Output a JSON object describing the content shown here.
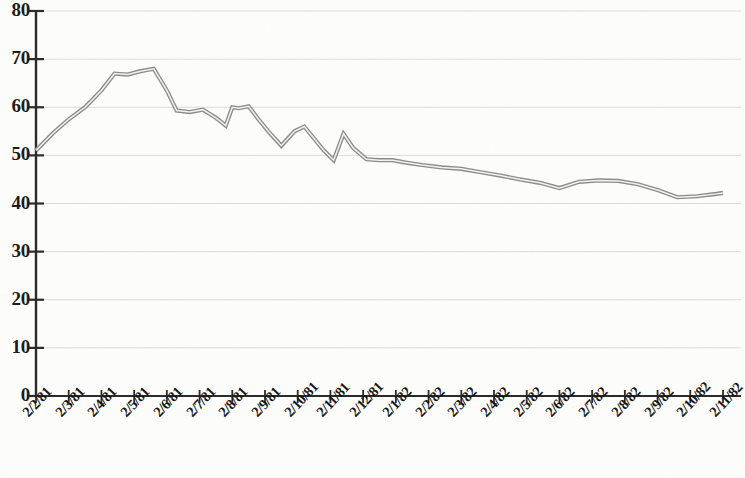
{
  "chart_data": {
    "type": "line",
    "title": "",
    "subtitle": "",
    "xlabel": "",
    "ylabel": "",
    "grid": true,
    "legend": "none",
    "ylim": [
      0,
      80
    ],
    "yticks": [
      0,
      10,
      20,
      30,
      40,
      50,
      60,
      70,
      80
    ],
    "ytick_labels": [
      "0",
      "10",
      "20",
      "30",
      "40",
      "50",
      "60",
      "70",
      "80"
    ],
    "categories": [
      "2/2/81",
      "2/3/81",
      "2/4/81",
      "2/5/81",
      "2/6/81",
      "2/7/81",
      "2/8/81",
      "2/9/81",
      "2/10/81",
      "2/11/81",
      "2/12/81",
      "2/1/82",
      "2/2/82",
      "2/3/82",
      "2/4/82",
      "2/5/82",
      "2/6/82",
      "2/7/82",
      "2/8/82",
      "2/9/82",
      "2/10/82",
      "2/11/82"
    ],
    "series": [
      {
        "name": "value",
        "color": "#8c8c8c",
        "x": [
          0,
          0.5,
          1,
          1.5,
          2,
          2.4,
          2.8,
          3.2,
          3.6,
          4,
          4.3,
          4.7,
          5.1,
          5.5,
          5.8,
          6.0,
          6.2,
          6.5,
          6.8,
          7.1,
          7.5,
          7.9,
          8.2,
          8.5,
          8.8,
          9.1,
          9.4,
          9.7,
          10.1,
          10.5,
          10.9,
          11.3,
          11.8,
          12.4,
          13.0,
          13.6,
          14.2,
          14.8,
          15.4,
          16.0,
          16.6,
          17.2,
          17.8,
          18.4,
          19.0,
          19.6,
          20.2,
          20.8,
          21.0
        ],
        "values": [
          51.0,
          54.5,
          57.5,
          60.0,
          63.5,
          67.0,
          66.8,
          67.5,
          68.0,
          63.5,
          59.3,
          59.0,
          59.5,
          57.8,
          56.2,
          60.0,
          59.8,
          60.2,
          57.5,
          55.0,
          52.0,
          55.0,
          56.0,
          53.5,
          51.0,
          49.0,
          54.5,
          51.5,
          49.2,
          49.0,
          49.0,
          48.5,
          48.0,
          47.5,
          47.2,
          46.5,
          45.8,
          45.0,
          44.3,
          43.2,
          44.5,
          44.8,
          44.7,
          44.0,
          42.8,
          41.3,
          41.5,
          42.0,
          42.2
        ]
      }
    ]
  },
  "axes": {
    "y_axis_name": "y-axis",
    "x_axis_name": "x-axis"
  }
}
